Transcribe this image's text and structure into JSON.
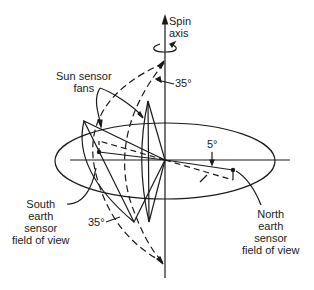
{
  "diagram": {
    "labels": {
      "spin_axis_line1": "Spin",
      "spin_axis_line2": "axis",
      "sun_sensor_line1": "Sun sensor",
      "sun_sensor_line2": "fans",
      "angle_top": "35°",
      "angle_bottom": "35°",
      "angle_small": "5°",
      "south_line1": "South",
      "south_line2": "earth",
      "south_line3": "sensor",
      "south_line4": "field of view",
      "north_line1": "North",
      "north_line2": "earth",
      "north_line3": "sensor",
      "north_line4": "field of view"
    },
    "colors": {
      "ink": "#1a1a1a",
      "background": "#ffffff"
    }
  }
}
